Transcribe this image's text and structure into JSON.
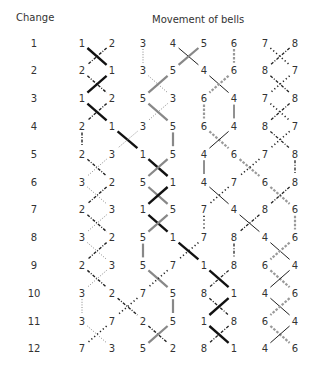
{
  "headers": {
    "change": "Change",
    "movement": "Movement of bells"
  },
  "layout": {
    "change_x": 34,
    "column_x": [
      82,
      112,
      143,
      173,
      204,
      234,
      265,
      295
    ],
    "row_y0": 43,
    "row_step": 27.8
  },
  "changes": [
    {
      "label": "1",
      "order": [
        1,
        2,
        3,
        4,
        5,
        6,
        7,
        8
      ]
    },
    {
      "label": "2",
      "order": [
        2,
        1,
        3,
        5,
        4,
        6,
        8,
        7
      ]
    },
    {
      "label": "3",
      "order": [
        1,
        2,
        5,
        3,
        6,
        4,
        7,
        8
      ]
    },
    {
      "label": "4",
      "order": [
        2,
        1,
        3,
        5,
        6,
        4,
        8,
        7
      ]
    },
    {
      "label": "5",
      "order": [
        2,
        3,
        1,
        5,
        4,
        6,
        7,
        8
      ]
    },
    {
      "label": "6",
      "order": [
        3,
        2,
        5,
        1,
        4,
        7,
        6,
        8
      ]
    },
    {
      "label": "7",
      "order": [
        2,
        3,
        1,
        5,
        7,
        4,
        8,
        6
      ]
    },
    {
      "label": "8",
      "order": [
        3,
        2,
        5,
        1,
        7,
        8,
        4,
        6
      ]
    },
    {
      "label": "9",
      "order": [
        2,
        3,
        5,
        7,
        1,
        8,
        6,
        4
      ]
    },
    {
      "label": "10",
      "order": [
        3,
        2,
        7,
        5,
        8,
        1,
        4,
        6
      ]
    },
    {
      "label": "11",
      "order": [
        3,
        7,
        2,
        5,
        1,
        8,
        6,
        4
      ]
    },
    {
      "label": "12",
      "order": [
        7,
        3,
        5,
        2,
        8,
        1,
        4,
        6
      ]
    }
  ],
  "bell_styles": {
    "1": {
      "color": "#111111",
      "width": 2.4,
      "dash": ""
    },
    "2": {
      "color": "#222222",
      "width": 1.4,
      "dash": "3 1.5 1 1.5"
    },
    "3": {
      "color": "#888888",
      "width": 1.0,
      "dash": "1 1.6"
    },
    "4": {
      "color": "#222222",
      "width": 1.0,
      "dash": ""
    },
    "5": {
      "color": "#888888",
      "width": 2.2,
      "dash": ""
    },
    "6": {
      "color": "#999999",
      "width": 2.2,
      "dash": "2.5 1.5"
    },
    "7": {
      "color": "#222222",
      "width": 1.6,
      "dash": "1.2 2.6"
    },
    "8": {
      "color": "#222222",
      "width": 1.3,
      "dash": "3 1.6 1 1.6"
    }
  }
}
